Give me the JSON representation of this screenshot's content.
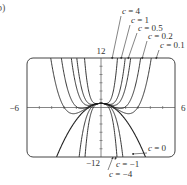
{
  "panel_label": "b)",
  "chart_data": {
    "type": "line",
    "title": "",
    "function": "f(x) = c x^4 - x^2 + 1",
    "xlabel": "",
    "ylabel": "",
    "xlim": [
      -6,
      6
    ],
    "ylim": [
      -12,
      12
    ],
    "x_tick_labels": [
      "-6",
      "6"
    ],
    "y_tick_labels": [
      "12",
      "-12"
    ],
    "x_ticks": [
      -5,
      -4,
      -3,
      -2,
      -1,
      1,
      2,
      3,
      4,
      5
    ],
    "y_ticks": [
      -10,
      -8,
      -6,
      -4,
      -2,
      2,
      4,
      6,
      8,
      10
    ],
    "grid": false,
    "series": [
      {
        "name": "c = 4",
        "c": 4,
        "label": "c = 4"
      },
      {
        "name": "c = 1",
        "c": 1,
        "label": "c = 1"
      },
      {
        "name": "c = 0.5",
        "c": 0.5,
        "label": "c = 0.5"
      },
      {
        "name": "c = 0.2",
        "c": 0.2,
        "label": "c = 0.2"
      },
      {
        "name": "c = 0.1",
        "c": 0.1,
        "label": "c = 0.1"
      },
      {
        "name": "c = 0",
        "c": 0,
        "label": "c = 0"
      },
      {
        "name": "c = -1",
        "c": -1,
        "label": "c = −1"
      },
      {
        "name": "c = -4",
        "c": -4,
        "label": "c = −4"
      }
    ],
    "annotations": [
      {
        "text": "c = 4",
        "x": 122,
        "y": 14,
        "arrow_to": [
          112,
          59
        ]
      },
      {
        "text": "c = 1",
        "x": 131,
        "y": 23,
        "arrow_to": [
          121,
          59
        ]
      },
      {
        "text": "c = 0.5",
        "x": 138,
        "y": 31,
        "arrow_to": [
          128,
          59
        ]
      },
      {
        "text": "c = 0.2",
        "x": 148,
        "y": 39,
        "arrow_to": [
          142,
          59
        ]
      },
      {
        "text": "c = 0.1",
        "x": 160,
        "y": 48,
        "arrow_to": [
          156,
          59
        ]
      },
      {
        "text": "c = 0",
        "x": 148,
        "y": 151,
        "arrow_to": [
          132,
          154
        ]
      },
      {
        "text": "c = −1",
        "x": 116,
        "y": 167,
        "arrow_to": [
          116,
          157
        ]
      },
      {
        "text": "c = −4",
        "x": 109,
        "y": 177,
        "arrow_to": [
          113,
          157
        ]
      }
    ]
  }
}
